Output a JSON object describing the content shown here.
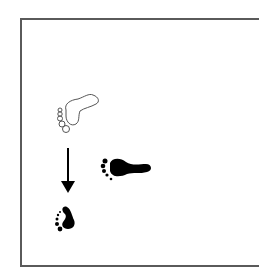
{
  "diagram": {
    "description": "Footprint sequence diagram: an outlined (previous) footprint, a downward arrow, and two filled footprints",
    "elements": [
      {
        "id": "outline-footprint",
        "style": "outline",
        "color": "#555555",
        "orientation": "pointing up-right"
      },
      {
        "id": "down-arrow",
        "style": "arrow",
        "direction": "down",
        "color": "#000000"
      },
      {
        "id": "filled-footprint-large",
        "style": "filled",
        "color": "#000000",
        "orientation": "pointing right"
      },
      {
        "id": "filled-footprint-small",
        "style": "filled",
        "color": "#000000",
        "orientation": "pointing up"
      }
    ],
    "colors": {
      "frame": "#5a5a5a",
      "ink": "#000000",
      "outline": "#555555",
      "background": "#ffffff"
    }
  }
}
